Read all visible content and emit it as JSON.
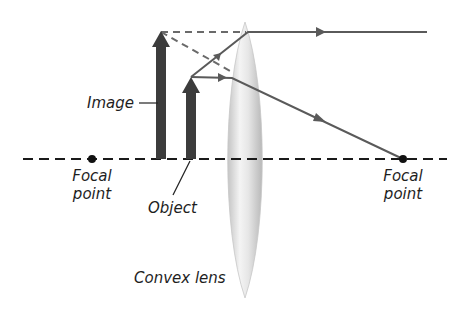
{
  "labels": {
    "image": "Image",
    "object": "Object",
    "lens": "Convex lens",
    "focal_left_line1": "Focal",
    "focal_left_line2": "point",
    "focal_right_line1": "Focal",
    "focal_right_line2": "point"
  },
  "colors": {
    "arrow": "#3c3c3c",
    "ray": "#5a5a5a",
    "dashed": "#6a6a6a",
    "axis": "#1a1a1a",
    "lens_light": "#f2f2f2",
    "lens_dark": "#bdbdbd"
  },
  "geometry": {
    "axis_y": 159,
    "focal_left_x": 92,
    "focal_right_x": 403,
    "lens_center_x": 245,
    "lens_top_y": 22,
    "lens_bottom_y": 298,
    "object_x": 191,
    "object_tip_y": 77,
    "image_x": 161,
    "image_tip_y": 32
  }
}
